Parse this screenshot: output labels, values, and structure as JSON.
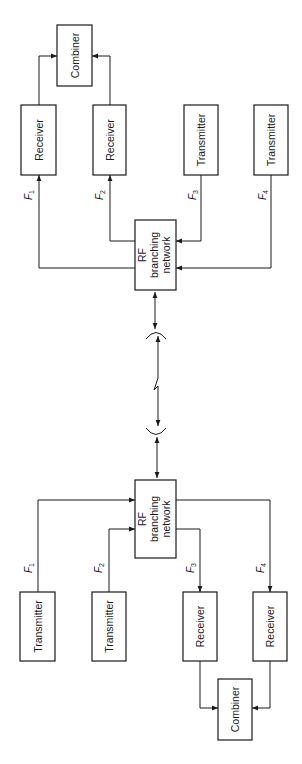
{
  "diagram": {
    "type": "block-diagram",
    "orientation": "rotated-90",
    "top_station": {
      "combiner": {
        "label": "Combiner"
      },
      "receivers": [
        {
          "label": "Receiver",
          "freq": "F",
          "sub": "1"
        },
        {
          "label": "Receiver",
          "freq": "F",
          "sub": "2"
        }
      ],
      "transmitters": [
        {
          "label": "Transmitter",
          "freq": "F",
          "sub": "3"
        },
        {
          "label": "Transmitter",
          "freq": "F",
          "sub": "4"
        }
      ],
      "rf_network": {
        "line1": "RF",
        "line2": "branching",
        "line3": "network"
      }
    },
    "bottom_station": {
      "transmitters": [
        {
          "label": "Transmitter",
          "freq": "F",
          "sub": "1"
        },
        {
          "label": "Transmitter",
          "freq": "F",
          "sub": "2"
        }
      ],
      "receivers": [
        {
          "label": "Receiver",
          "freq": "F",
          "sub": "3"
        },
        {
          "label": "Receiver",
          "freq": "F",
          "sub": "4"
        }
      ],
      "combiner": {
        "label": "Combiner"
      },
      "rf_network": {
        "line1": "RF",
        "line2": "branching",
        "line3": "network"
      }
    },
    "link": {
      "type": "radio-path",
      "antennas": 2
    },
    "colors": {
      "stroke": "#1a1a1a",
      "background": "#ffffff"
    }
  }
}
